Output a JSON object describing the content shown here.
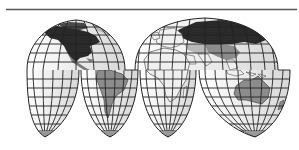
{
  "map": {
    "projection": "interrupted-homolosine",
    "background": "#ffffff",
    "rule_color": "#555555",
    "ocean_fill": "#e8e8e8",
    "ocean_fill_light": "#f4f4f4",
    "land_fill": "#f0f0f0",
    "graticule_color": "#222222",
    "outline_color": "#222222",
    "highlight_dark": "#2a2a2a",
    "highlight_medium": "#8c8c8c",
    "highlight_light": "#b8b8b8",
    "regions": [
      {
        "name": "north-america",
        "shade": "dark"
      },
      {
        "name": "russia",
        "shade": "dark"
      },
      {
        "name": "south-america",
        "shade": "medium"
      },
      {
        "name": "china",
        "shade": "medium"
      },
      {
        "name": "australia",
        "shade": "medium"
      },
      {
        "name": "greenland",
        "shade": "light"
      },
      {
        "name": "africa",
        "shade": "none"
      },
      {
        "name": "europe",
        "shade": "none"
      }
    ]
  }
}
